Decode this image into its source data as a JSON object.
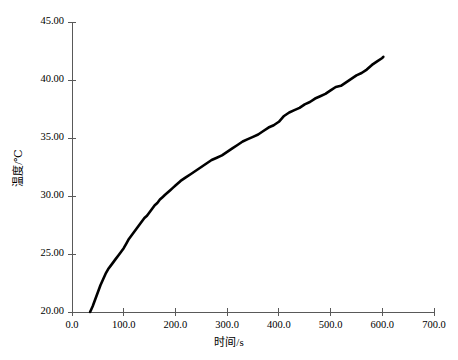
{
  "chart_data": {
    "type": "line",
    "title": "",
    "xlabel": "时间/s",
    "ylabel": "温度/℃",
    "xlim": [
      0,
      700
    ],
    "ylim": [
      20,
      45
    ],
    "xticks": [
      "0.0",
      "100.0",
      "200.0",
      "300.0",
      "400.0",
      "500.0",
      "600.0",
      "700.0"
    ],
    "xtick_values": [
      0,
      100,
      200,
      300,
      400,
      500,
      600,
      700
    ],
    "yticks": [
      "20.00",
      "25.00",
      "30.00",
      "35.00",
      "40.00",
      "45.00"
    ],
    "ytick_values": [
      20,
      25,
      30,
      35,
      40,
      45
    ],
    "grid": false,
    "legend": null,
    "line_color": "#000000",
    "axis_color": "#595959",
    "series": [
      {
        "name": "温度",
        "x": [
          35,
          40,
          45,
          50,
          55,
          60,
          65,
          70,
          75,
          80,
          85,
          90,
          95,
          100,
          105,
          110,
          115,
          120,
          125,
          130,
          135,
          140,
          145,
          150,
          155,
          160,
          165,
          170,
          175,
          180,
          185,
          190,
          195,
          200,
          210,
          220,
          230,
          240,
          250,
          260,
          270,
          280,
          290,
          300,
          310,
          320,
          330,
          340,
          350,
          360,
          370,
          380,
          390,
          400,
          410,
          420,
          430,
          440,
          450,
          460,
          470,
          480,
          490,
          500,
          510,
          520,
          530,
          540,
          550,
          560,
          570,
          580,
          590,
          600,
          602
        ],
        "y": [
          20.0,
          20.5,
          21.1,
          21.7,
          22.3,
          22.8,
          23.3,
          23.7,
          24.0,
          24.3,
          24.6,
          24.9,
          25.2,
          25.5,
          25.9,
          26.3,
          26.6,
          26.9,
          27.2,
          27.5,
          27.8,
          28.1,
          28.3,
          28.6,
          28.9,
          29.2,
          29.4,
          29.7,
          29.9,
          30.1,
          30.3,
          30.5,
          30.7,
          30.9,
          31.3,
          31.6,
          31.9,
          32.2,
          32.5,
          32.8,
          33.1,
          33.3,
          33.5,
          33.8,
          34.1,
          34.4,
          34.7,
          34.9,
          35.1,
          35.3,
          35.6,
          35.9,
          36.1,
          36.4,
          36.9,
          37.2,
          37.4,
          37.6,
          37.9,
          38.1,
          38.4,
          38.6,
          38.8,
          39.1,
          39.4,
          39.5,
          39.8,
          40.1,
          40.4,
          40.6,
          40.9,
          41.3,
          41.6,
          41.9,
          42.0
        ]
      }
    ]
  },
  "axes_geometry": {
    "plot_left": 72,
    "plot_right": 434,
    "plot_top": 22,
    "plot_bottom": 312
  }
}
